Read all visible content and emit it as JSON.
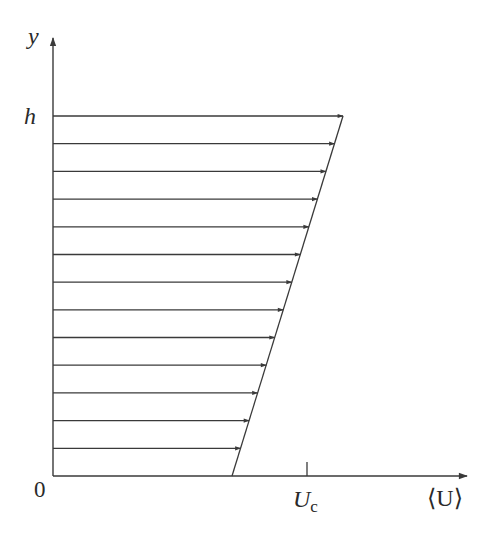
{
  "diagram": {
    "type": "velocity-profile",
    "axes": {
      "y_label": "y",
      "x_label": "⟨U⟩",
      "origin_label": "0",
      "y_tick_label": "h",
      "x_tick_label": "U",
      "x_tick_subscript": "c"
    },
    "profile": {
      "description": "Linear mean velocity profile from a nonzero value at y=0 up to y=h, with horizontal arrows",
      "arrow_count": 13,
      "bottom_value_fraction_of_Uc": 0.71,
      "top_value_fraction_of_Uc": 1.14
    },
    "colors": {
      "stroke": "#3a3a3a",
      "background": "#ffffff"
    }
  }
}
